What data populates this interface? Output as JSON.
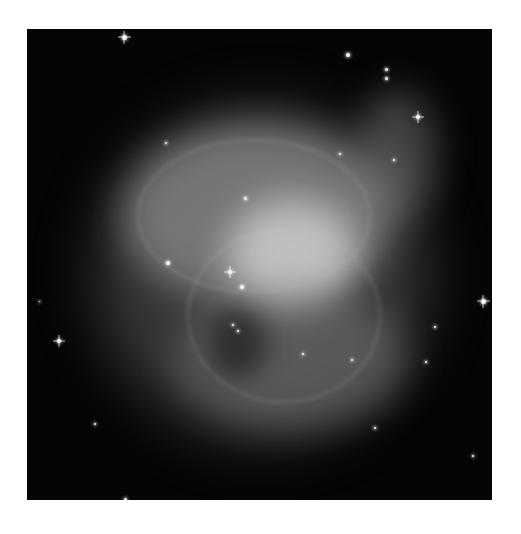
{
  "image": {
    "subject": "Crab Nebula",
    "style": "grayscale astronomical photograph",
    "background_color": "#ffffff",
    "sky_color": "#050505"
  },
  "stars": [
    {
      "x": 97,
      "y": 8,
      "size": 5,
      "spiked": true
    },
    {
      "x": 321,
      "y": 26,
      "size": 4,
      "spiked": false
    },
    {
      "x": 359,
      "y": 40,
      "size": 3,
      "spiked": false
    },
    {
      "x": 359,
      "y": 49,
      "size": 3,
      "spiked": false
    },
    {
      "x": 391,
      "y": 88,
      "size": 4,
      "spiked": true
    },
    {
      "x": 456,
      "y": 272,
      "size": 5,
      "spiked": true
    },
    {
      "x": 32,
      "y": 312,
      "size": 4,
      "spiked": true
    },
    {
      "x": 141,
      "y": 234,
      "size": 4,
      "spiked": false
    },
    {
      "x": 203,
      "y": 243,
      "size": 4,
      "spiked": true
    },
    {
      "x": 215,
      "y": 258,
      "size": 4,
      "spiked": false
    },
    {
      "x": 218,
      "y": 169,
      "size": 3,
      "spiked": false
    },
    {
      "x": 408,
      "y": 298,
      "size": 2,
      "spiked": false
    },
    {
      "x": 399,
      "y": 333,
      "size": 2,
      "spiked": false
    },
    {
      "x": 325,
      "y": 331,
      "size": 2,
      "spiked": false
    },
    {
      "x": 276,
      "y": 325,
      "size": 2,
      "spiked": false
    },
    {
      "x": 348,
      "y": 399,
      "size": 2,
      "spiked": false
    },
    {
      "x": 98,
      "y": 470,
      "size": 3,
      "spiked": false
    },
    {
      "x": 68,
      "y": 395,
      "size": 2,
      "spiked": false
    },
    {
      "x": 446,
      "y": 427,
      "size": 2,
      "spiked": false
    },
    {
      "x": 12,
      "y": 272,
      "size": 1,
      "spiked": false
    },
    {
      "x": 206,
      "y": 296,
      "size": 2,
      "spiked": false
    },
    {
      "x": 211,
      "y": 302,
      "size": 2,
      "spiked": false
    },
    {
      "x": 139,
      "y": 114,
      "size": 2,
      "spiked": false
    },
    {
      "x": 313,
      "y": 125,
      "size": 2,
      "spiked": false
    },
    {
      "x": 367,
      "y": 131,
      "size": 2,
      "spiked": false
    }
  ]
}
